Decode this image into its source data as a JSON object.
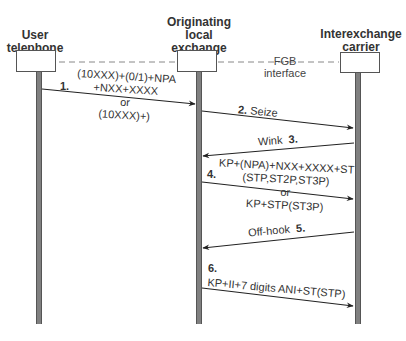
{
  "participants": [
    {
      "id": "user",
      "label_lines": [
        "User",
        "telephone"
      ]
    },
    {
      "id": "orig",
      "label_lines": [
        "Originating",
        "local",
        "exchange"
      ]
    },
    {
      "id": "ixc",
      "label_lines": [
        "Interexchange",
        "carrier"
      ]
    }
  ],
  "interface": {
    "lines": [
      "FGB",
      "interface"
    ]
  },
  "messages": [
    {
      "num": "1.",
      "lines": [
        "(10XXX)+(0/1)+NPA",
        "+NXX+XXXX",
        "or",
        "(10XXX)+)"
      ],
      "from": "user",
      "to": "orig"
    },
    {
      "num": "2.",
      "lines": [
        "Seize"
      ],
      "from": "orig",
      "to": "ixc"
    },
    {
      "num": "3.",
      "lines": [
        "Wink"
      ],
      "from": "ixc",
      "to": "orig"
    },
    {
      "num": "4.",
      "lines": [
        "KP+(NPA)+NXX+XXXX+ST",
        "(STP,ST2P,ST3P)",
        "or",
        "KP+STP(ST3P)"
      ],
      "from": "orig",
      "to": "ixc"
    },
    {
      "num": "5.",
      "lines": [
        "Off-hook"
      ],
      "from": "ixc",
      "to": "orig"
    },
    {
      "num": "6.",
      "lines": [
        "KP+II+7 digits ANI+ST(STP)"
      ],
      "from": "orig",
      "to": "ixc"
    }
  ]
}
